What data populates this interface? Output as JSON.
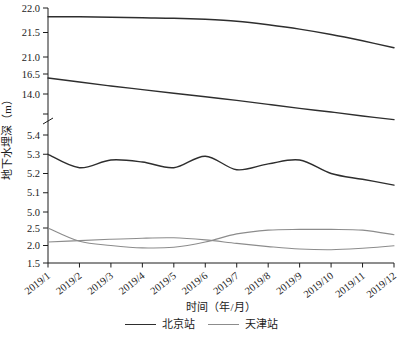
{
  "chart_data": {
    "type": "line",
    "xlabel": "时间（年/月）",
    "ylabel": "地下水埋深（m）",
    "x_categories": [
      "2019/1",
      "2019/2",
      "2019/3",
      "2019/4",
      "2019/5",
      "2019/6",
      "2019/7",
      "2019/8",
      "2019/9",
      "2019/10",
      "2019/11",
      "2019/12"
    ],
    "axis_note": "y-axis has scale breaks between 21.0/16.5, 11.5/5.4 (slash mark drawn) and 5.0/2.5",
    "y_segments": [
      {
        "id": "top",
        "range": [
          21.0,
          22.0
        ],
        "ticks": [
          {
            "v": 22.0,
            "label": "22.0"
          },
          {
            "v": 21.5,
            "label": "21.5"
          },
          {
            "v": 21.0,
            "label": "21.0"
          }
        ]
      },
      {
        "id": "mid",
        "range": [
          10.75,
          16.5
        ],
        "ticks": [
          {
            "v": 16.5,
            "label": "16.5"
          },
          {
            "v": 14.0,
            "label": "14.0"
          },
          {
            "v": 11.5,
            "label": ""
          }
        ]
      },
      {
        "id": "five",
        "range": [
          5.0,
          5.4
        ],
        "ticks": [
          {
            "v": 5.4,
            "label": "5.4"
          },
          {
            "v": 5.3,
            "label": "5.3"
          },
          {
            "v": 5.2,
            "label": "5.2"
          },
          {
            "v": 5.1,
            "label": "5.1"
          },
          {
            "v": 5.0,
            "label": "5.0"
          }
        ]
      },
      {
        "id": "low",
        "range": [
          1.5,
          2.5
        ],
        "ticks": [
          {
            "v": 2.5,
            "label": "2.5"
          },
          {
            "v": 2.0,
            "label": "2.0"
          },
          {
            "v": 1.5,
            "label": "1.5"
          }
        ]
      }
    ],
    "series": [
      {
        "name": "beijing-well-1",
        "station": "北京站",
        "segment": "top",
        "values": [
          21.82,
          21.82,
          21.81,
          21.8,
          21.79,
          21.77,
          21.73,
          21.66,
          21.57,
          21.46,
          21.33,
          21.19
        ]
      },
      {
        "name": "beijing-well-2",
        "station": "北京站",
        "segment": "mid",
        "values": [
          16.0,
          15.5,
          15.0,
          14.55,
          14.1,
          13.65,
          13.2,
          12.7,
          12.2,
          11.75,
          11.25,
          10.8
        ]
      },
      {
        "name": "beijing-well-3",
        "station": "北京站",
        "segment": "five",
        "values": [
          5.3,
          5.23,
          5.27,
          5.26,
          5.23,
          5.29,
          5.22,
          5.25,
          5.27,
          5.2,
          5.17,
          5.14
        ]
      },
      {
        "name": "tianjin-well-1",
        "station": "天津站",
        "segment": "low",
        "values": [
          2.5,
          2.12,
          2.0,
          1.93,
          1.95,
          2.1,
          2.33,
          2.44,
          2.46,
          2.46,
          2.44,
          2.31
        ]
      },
      {
        "name": "tianjin-well-2",
        "station": "天津站",
        "segment": "low",
        "values": [
          2.1,
          2.14,
          2.18,
          2.21,
          2.22,
          2.16,
          2.06,
          1.97,
          1.9,
          1.88,
          1.92,
          1.99
        ]
      }
    ],
    "legend": [
      {
        "label": "北京站",
        "color": "#2e2e2e",
        "width": 1.4
      },
      {
        "label": "天津站",
        "color": "#8c8c8c",
        "width": 1.1
      }
    ],
    "axis_color": "#1c1c1c"
  }
}
